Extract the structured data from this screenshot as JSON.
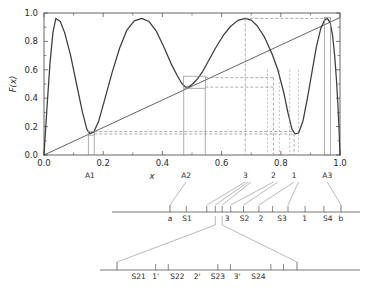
{
  "chart_data": {
    "type": "line",
    "title": "",
    "xlabel": "x",
    "ylabel": "F(x)",
    "xlim": [
      0.0,
      1.0
    ],
    "ylim": [
      0.0,
      1.0
    ],
    "grid": false,
    "legend": "none",
    "xticks": [
      "0.0",
      "0.2",
      "0.4",
      "0.6",
      "0.8",
      "1.0"
    ],
    "xtick_values": [
      0.0,
      0.2,
      0.4,
      0.6,
      0.8,
      1.0
    ],
    "yticks": [
      "0.0",
      "0.2",
      "0.4",
      "0.6",
      "0.8",
      "1.0"
    ],
    "ytick_values": [
      0.0,
      0.2,
      0.4,
      0.6,
      0.8,
      1.0
    ],
    "series": [
      {
        "name": "F(x)",
        "style": "solid",
        "description": "oscillating curve with three minima near 0.155, 0.48, 0.845 and maxima near 0.04, 0.33, 0.68, 0.955",
        "points": [
          [
            0.0,
            0.0
          ],
          [
            0.01,
            0.33
          ],
          [
            0.02,
            0.64
          ],
          [
            0.03,
            0.86
          ],
          [
            0.04,
            0.962
          ],
          [
            0.055,
            0.94
          ],
          [
            0.07,
            0.86
          ],
          [
            0.09,
            0.7
          ],
          [
            0.11,
            0.5
          ],
          [
            0.13,
            0.3
          ],
          [
            0.145,
            0.18
          ],
          [
            0.155,
            0.15
          ],
          [
            0.168,
            0.16
          ],
          [
            0.185,
            0.24
          ],
          [
            0.205,
            0.39
          ],
          [
            0.23,
            0.58
          ],
          [
            0.255,
            0.75
          ],
          [
            0.28,
            0.88
          ],
          [
            0.305,
            0.945
          ],
          [
            0.33,
            0.962
          ],
          [
            0.355,
            0.94
          ],
          [
            0.38,
            0.87
          ],
          [
            0.405,
            0.76
          ],
          [
            0.43,
            0.64
          ],
          [
            0.45,
            0.56
          ],
          [
            0.465,
            0.505
          ],
          [
            0.478,
            0.478
          ],
          [
            0.49,
            0.48
          ],
          [
            0.505,
            0.505
          ],
          [
            0.52,
            0.54
          ],
          [
            0.535,
            0.585
          ],
          [
            0.555,
            0.66
          ],
          [
            0.58,
            0.755
          ],
          [
            0.605,
            0.84
          ],
          [
            0.63,
            0.905
          ],
          [
            0.655,
            0.948
          ],
          [
            0.68,
            0.962
          ],
          [
            0.7,
            0.95
          ],
          [
            0.72,
            0.91
          ],
          [
            0.745,
            0.83
          ],
          [
            0.77,
            0.715
          ],
          [
            0.79,
            0.6
          ],
          [
            0.81,
            0.44
          ],
          [
            0.825,
            0.29
          ],
          [
            0.838,
            0.18
          ],
          [
            0.848,
            0.148
          ],
          [
            0.86,
            0.155
          ],
          [
            0.875,
            0.24
          ],
          [
            0.89,
            0.4
          ],
          [
            0.905,
            0.58
          ],
          [
            0.92,
            0.76
          ],
          [
            0.935,
            0.89
          ],
          [
            0.948,
            0.95
          ],
          [
            0.957,
            0.962
          ],
          [
            0.967,
            0.93
          ],
          [
            0.975,
            0.84
          ],
          [
            0.982,
            0.7
          ],
          [
            0.988,
            0.53
          ],
          [
            0.993,
            0.35
          ],
          [
            0.997,
            0.17
          ],
          [
            1.0,
            0.0
          ]
        ]
      },
      {
        "name": "diagonal",
        "style": "solid-thin",
        "description": "identity line y = x from (0,0) to (1,0.97)",
        "points": [
          [
            0.0,
            0.0
          ],
          [
            1.0,
            0.968
          ]
        ]
      }
    ],
    "fixed_points": [
      {
        "label": "A1",
        "x": 0.155,
        "y": 0.15
      },
      {
        "label": "A2",
        "x": 0.48,
        "y": 0.478
      },
      {
        "label": "A3",
        "x": 0.957,
        "y": 0.962
      }
    ],
    "marked_points": [
      {
        "label": "3",
        "x": 0.68,
        "y": 0.962
      },
      {
        "label": "2",
        "x": 0.775,
        "y": 0.545
      },
      {
        "label": "1",
        "x": 0.845,
        "y": 0.15
      }
    ],
    "boxes": [
      {
        "x0": 0.15,
        "x1": 0.17,
        "y0": 0.14,
        "y1": 0.165
      },
      {
        "x0": 0.472,
        "x1": 0.545,
        "y0": 0.47,
        "y1": 0.555
      },
      {
        "x0": 0.948,
        "x1": 0.968,
        "y0": 0.0,
        "y1": 0.97
      }
    ]
  },
  "axis": {
    "x_label": "x",
    "y_label": "F(x)"
  },
  "row2": {
    "name": "interval-decomposition-level-1",
    "left_label": "a",
    "right_label": "b",
    "segments": [
      {
        "label": "S1",
        "x": 0.565
      },
      {
        "label": "3",
        "x": 0.672
      },
      {
        "label": "S2",
        "x": 0.718
      },
      {
        "label": "2",
        "x": 0.762
      },
      {
        "label": "S3",
        "x": 0.818
      },
      {
        "label": "1",
        "x": 0.878
      },
      {
        "label": "S4",
        "x": 0.94
      }
    ]
  },
  "row3": {
    "name": "interval-decomposition-level-2",
    "segments": [
      {
        "label": "S21",
        "x": 0.12
      },
      {
        "label": "1'",
        "x": 0.215
      },
      {
        "label": "S22",
        "x": 0.335
      },
      {
        "label": "2'",
        "x": 0.445
      },
      {
        "label": "S23",
        "x": 0.56
      },
      {
        "label": "3'",
        "x": 0.668
      },
      {
        "label": "S24",
        "x": 0.785
      }
    ]
  },
  "colors": {
    "curve": "#3c3c3c",
    "axis": "#555555",
    "guide": "#8a8a8a",
    "dashed": "#8a8a8a",
    "text": "#2b2b2b",
    "background": "#ffffff"
  }
}
